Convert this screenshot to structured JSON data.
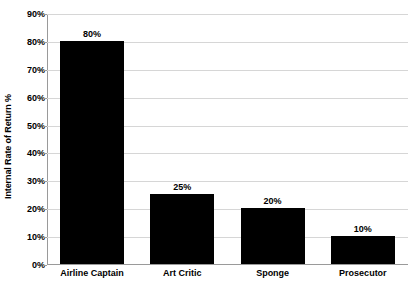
{
  "chart_data": {
    "type": "bar",
    "title": "",
    "xlabel": "",
    "ylabel": "Internal Rate of Return %",
    "categories": [
      "Airline Captain",
      "Art Critic",
      "Sponge",
      "Prosecutor"
    ],
    "values": [
      80,
      25,
      20,
      10
    ],
    "data_labels": [
      "80%",
      "25%",
      "20%",
      "10%"
    ],
    "ylim": [
      0,
      90
    ],
    "ytick_values": [
      0,
      10,
      20,
      30,
      40,
      50,
      60,
      70,
      80,
      90
    ],
    "ytick_labels": [
      "0%",
      "10%",
      "20%",
      "30%",
      "40%",
      "50%",
      "60%",
      "70%",
      "80%",
      "90%"
    ],
    "grid": "horizontal",
    "legend": "none",
    "bar_color": "#000000",
    "gridline_color": "#d6d6d6",
    "axis_color": "#9a9a9a",
    "background_color": "#ffffff",
    "text_color": "#000000"
  }
}
